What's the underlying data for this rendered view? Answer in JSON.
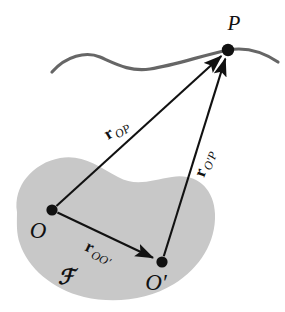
{
  "figure": {
    "type": "vector-kinematics-diagram",
    "background_color": "#ffffff",
    "body_fill_color": "#c8c8c8",
    "curve_color": "#666666",
    "ink_color": "#111111"
  },
  "points": [
    {
      "id": "P",
      "label": "P",
      "x": 228,
      "y": 50,
      "label_x": 234,
      "label_y": 30
    },
    {
      "id": "O",
      "label": "O",
      "x": 52,
      "y": 210,
      "label_x": 38,
      "label_y": 238
    },
    {
      "id": "Oprime",
      "label": "O′",
      "x": 162,
      "y": 262,
      "label_x": 156,
      "label_y": 290
    }
  ],
  "vectors": [
    {
      "id": "r_OP",
      "from": "O",
      "to": "P",
      "symbol": "r",
      "subscript": "OP",
      "label_x": 108,
      "label_y": 140,
      "label_rotation": -31
    },
    {
      "id": "r_OprimeP",
      "from": "Oprime",
      "to": "P",
      "symbol": "r",
      "subscript": "O′P",
      "label_x": 204,
      "label_y": 178,
      "label_rotation": -70
    },
    {
      "id": "r_OOprime",
      "from": "O",
      "to": "Oprime",
      "symbol": "r",
      "subscript": "OO′",
      "label_x": 84,
      "label_y": 250,
      "label_rotation": 26
    }
  ],
  "frame": {
    "id": "F",
    "label": "ℱ",
    "label_x": 66,
    "label_y": 284
  },
  "curve": {
    "id": "trajectory-curve",
    "stroke_width": 3.2,
    "path": "M 52 72 C 66 56, 86 51, 100 57 C 116 64, 130 72, 150 69 C 176 65, 200 56, 228 50 C 250 46, 266 54, 278 62"
  },
  "body": {
    "id": "rigid-body-blob",
    "path": "M 17 212 C 13 186, 33 163, 60 158 C 82 154, 98 166, 118 177 C 136 187, 152 180, 172 177 C 196 173, 214 188, 215 214 C 216 242, 200 268, 174 284 C 148 300, 114 304, 84 297 C 52 289, 28 268, 20 244 C 16 233, 17 222, 17 212 Z"
  }
}
